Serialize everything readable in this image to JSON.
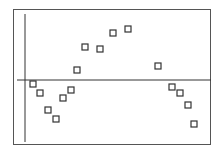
{
  "chart_data": {
    "type": "scatter",
    "title": "",
    "xlabel": "",
    "ylabel": "",
    "grid": false,
    "legend": null,
    "marker": "open-square",
    "note": "No tick labels shown; values in pixel units relative to axis origin (x right, y up).",
    "axes_origin_px": {
      "x": 25,
      "y": 80
    },
    "xlim": [
      -8,
      187
    ],
    "ylim": [
      -66,
      71
    ],
    "points": [
      {
        "x": 8,
        "y": -4
      },
      {
        "x": 15,
        "y": -13
      },
      {
        "x": 23,
        "y": -30
      },
      {
        "x": 31,
        "y": -39
      },
      {
        "x": 38,
        "y": -18
      },
      {
        "x": 46,
        "y": -10
      },
      {
        "x": 52,
        "y": 10
      },
      {
        "x": 60,
        "y": 33
      },
      {
        "x": 75,
        "y": 31
      },
      {
        "x": 88,
        "y": 47
      },
      {
        "x": 103,
        "y": 51
      },
      {
        "x": 133,
        "y": 14
      },
      {
        "x": 147,
        "y": -7
      },
      {
        "x": 155,
        "y": -13
      },
      {
        "x": 163,
        "y": -25
      },
      {
        "x": 169,
        "y": -44
      }
    ]
  },
  "colors": {
    "axis": "#333333",
    "frame": "#555555",
    "marker": "#333333",
    "background": "#ffffff"
  }
}
